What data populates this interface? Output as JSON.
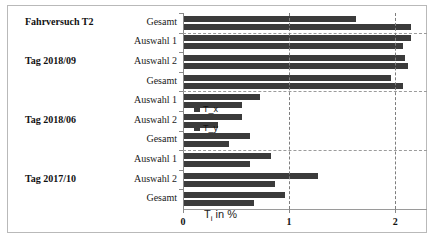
{
  "chart_data": {
    "type": "bar",
    "orientation": "horizontal",
    "title": "",
    "xlabel": "T_i in %",
    "ylabel": "",
    "xlim": [
      0,
      2.3
    ],
    "xticks": [
      0,
      1,
      2
    ],
    "xticklabels": [
      "0",
      "1",
      "2"
    ],
    "grid": true,
    "legend_position": "center-right",
    "legend": [
      "T_x",
      "T_y"
    ],
    "groups": [
      {
        "title": "Fahrversuch T2",
        "categories": [
          "Gesamt"
        ],
        "series": [
          {
            "name": "T_x",
            "values": [
              1.62
            ]
          },
          {
            "name": "T_y",
            "values": [
              2.14
            ]
          }
        ]
      },
      {
        "title": "Tag 2018/09",
        "categories": [
          "Auswahl 1",
          "Auswahl 2",
          "Gesamt"
        ],
        "series": [
          {
            "name": "T_x",
            "values": [
              2.14,
              2.08,
              1.95
            ]
          },
          {
            "name": "T_y",
            "values": [
              2.06,
              2.11,
              2.06
            ]
          }
        ]
      },
      {
        "title": "Tag 2018/06",
        "categories": [
          "Auswahl 1",
          "Auswahl 2",
          "Gesamt"
        ],
        "series": [
          {
            "name": "T_x",
            "values": [
              0.72,
              0.55,
              0.62
            ]
          },
          {
            "name": "T_y",
            "values": [
              0.55,
              0.32,
              0.42
            ]
          }
        ]
      },
      {
        "title": "Tag 2017/10",
        "categories": [
          "Auswahl 1",
          "Auswahl 2",
          "Gesamt"
        ],
        "series": [
          {
            "name": "T_x",
            "values": [
              0.82,
              1.26,
              0.95
            ]
          },
          {
            "name": "T_y",
            "values": [
              0.62,
              0.86,
              0.66
            ]
          }
        ]
      }
    ],
    "colors": {
      "T_x": "#3b3b3b",
      "T_y": "#3b3b3b",
      "grid": "#7d7d7d",
      "axis": "#8a8a8a"
    }
  },
  "axis": {
    "xaxis_title_main": "T",
    "xaxis_title_sub": "i",
    "xaxis_title_unit": " in %"
  }
}
